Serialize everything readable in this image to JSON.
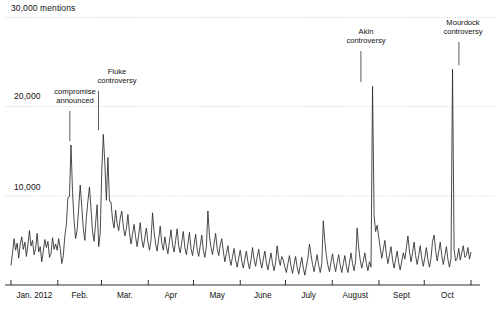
{
  "chart_data": {
    "type": "line",
    "title": "",
    "subtitle": "",
    "xlabel": "",
    "ylabel": "mentions",
    "ylim": [
      0,
      30000
    ],
    "xlim": [
      0,
      305
    ],
    "grid": true,
    "legend_position": "none",
    "y_ticks": [
      {
        "value": 30000,
        "label": "30,000 mentions"
      },
      {
        "value": 20000,
        "label": "20,000"
      },
      {
        "value": 10000,
        "label": "10,000"
      }
    ],
    "x_ticks": [
      {
        "label": "Jan. 2012",
        "day": 0
      },
      {
        "label": "Feb.",
        "day": 31
      },
      {
        "label": "Mar.",
        "day": 60
      },
      {
        "label": "Apr",
        "day": 91
      },
      {
        "label": "May",
        "day": 121
      },
      {
        "label": "June",
        "day": 152
      },
      {
        "label": "July",
        "day": 182
      },
      {
        "label": "August",
        "day": 213
      },
      {
        "label": "Sept",
        "day": 244
      },
      {
        "label": "Oct",
        "day": 274
      },
      {
        "label": "",
        "day": 305
      }
    ],
    "annotations": [
      {
        "name": "compromise-announced",
        "label_line1": "compromise",
        "label_line2": "announced",
        "day": 39,
        "value": 15700
      },
      {
        "name": "fluke-controversy",
        "label_line1": "Fluke",
        "label_line2": "controversy",
        "day": 58,
        "value": 16900
      },
      {
        "name": "akin-controversy",
        "label_line1": "Akin",
        "label_line2": "controversy",
        "day": 232,
        "value": 22300
      },
      {
        "name": "mourdock-controversy",
        "label_line1": "Mourdock",
        "label_line2": "controversy",
        "day": 297,
        "value": 24200
      }
    ],
    "series": [
      {
        "name": "mentions",
        "color": "#2a2a2a",
        "values": [
          2200,
          3600,
          5200,
          3900,
          4700,
          3000,
          4600,
          5400,
          4000,
          4800,
          3200,
          4500,
          6100,
          4400,
          5000,
          3400,
          4100,
          5800,
          3700,
          4300,
          2600,
          3800,
          5100,
          4200,
          4900,
          3100,
          3500,
          5300,
          4000,
          4600,
          3900,
          5200,
          4100,
          2400,
          3300,
          5500,
          6800,
          9800,
          9900,
          15700,
          10400,
          7200,
          5200,
          6200,
          8600,
          11200,
          8800,
          6300,
          5000,
          7600,
          9400,
          11000,
          8500,
          6000,
          4900,
          7000,
          9000,
          4300,
          5800,
          12800,
          16900,
          13600,
          9500,
          14300,
          9400,
          9300,
          7300,
          6400,
          8400,
          6900,
          6100,
          7500,
          8300,
          6600,
          5500,
          6300,
          7900,
          5900,
          4600,
          5700,
          6800,
          5400,
          4300,
          5600,
          7000,
          5100,
          4200,
          5300,
          6400,
          4800,
          3900,
          5000,
          8100,
          6000,
          4600,
          3800,
          5200,
          6600,
          4700,
          3900,
          5400,
          4300,
          3500,
          4900,
          6200,
          4500,
          3700,
          5000,
          6300,
          4400,
          3600,
          4800,
          6000,
          4200,
          3400,
          4600,
          5900,
          4100,
          3300,
          4500,
          5700,
          4000,
          3200,
          4400,
          5600,
          3900,
          3100,
          4300,
          8300,
          5500,
          4200,
          3400,
          4600,
          5800,
          4100,
          3300,
          4500,
          5200,
          3800,
          2600,
          3500,
          4400,
          3000,
          2200,
          3200,
          4100,
          2800,
          2000,
          3000,
          3900,
          2700,
          1900,
          2900,
          3800,
          2600,
          1800,
          2800,
          4200,
          2900,
          2100,
          3100,
          4000,
          2700,
          1900,
          2900,
          3800,
          2500,
          1700,
          2700,
          3600,
          2400,
          1600,
          2600,
          4400,
          3000,
          2200,
          3200,
          2800,
          2000,
          1400,
          2400,
          3300,
          2100,
          1300,
          2300,
          3200,
          2000,
          1200,
          2200,
          3100,
          1900,
          1100,
          2100,
          3000,
          4600,
          3400,
          2300,
          1500,
          2500,
          3400,
          2200,
          1400,
          2400,
          7200,
          4900,
          3300,
          2200,
          1500,
          2600,
          3500,
          2300,
          1500,
          2500,
          3400,
          2200,
          1400,
          2400,
          3300,
          2100,
          1400,
          2500,
          3600,
          2400,
          1600,
          2700,
          6400,
          4200,
          2800,
          1900,
          2700,
          3600,
          2400,
          1600,
          2600,
          2000,
          22300,
          7800,
          6000,
          6700,
          5400,
          4200,
          3000,
          4000,
          5000,
          3400,
          2400,
          3400,
          4300,
          2800,
          1900,
          2900,
          3800,
          2500,
          1700,
          2700,
          3600,
          2900,
          4200,
          5500,
          3800,
          2600,
          3600,
          4800,
          3300,
          2300,
          3300,
          4400,
          3000,
          2100,
          3100,
          4200,
          2900,
          2000,
          3000,
          4900,
          5600,
          3900,
          2700,
          3700,
          4800,
          3300,
          2300,
          3300,
          4300,
          2900,
          2000,
          3000,
          24200,
          4000,
          2700,
          3000,
          4100,
          2800,
          3600,
          4400,
          3100,
          3300,
          4200,
          2900,
          3700
        ]
      }
    ]
  }
}
